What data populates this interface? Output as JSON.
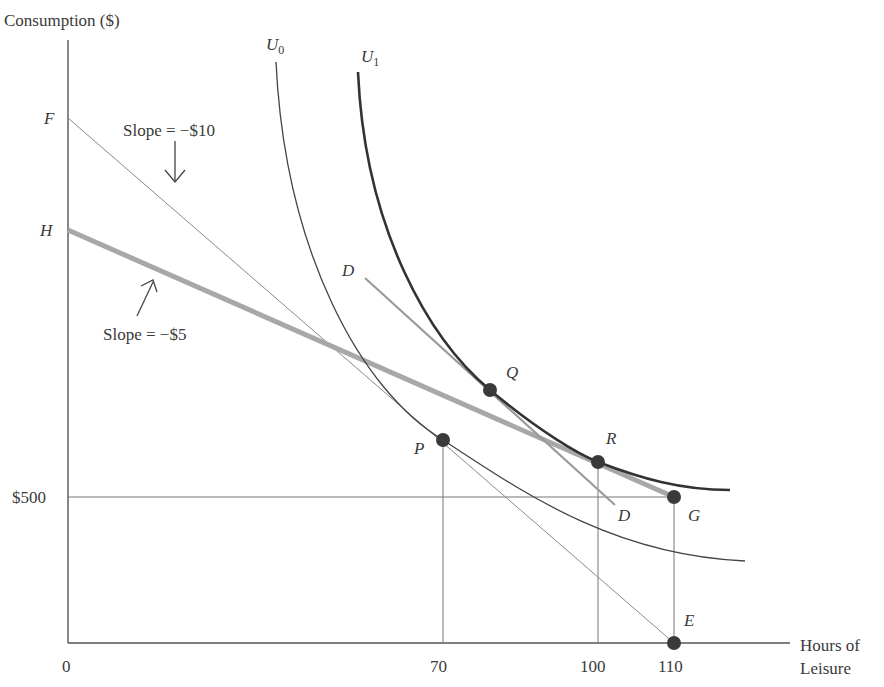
{
  "axes": {
    "y_label": "Consumption ($)",
    "x_label_line1": "Hours of",
    "x_label_line2": "Leisure",
    "origin": "0",
    "y_ticks": {
      "F": "F",
      "H": "H",
      "income": "$500"
    },
    "x_ticks": [
      "70",
      "100",
      "110"
    ]
  },
  "curves": {
    "u0": {
      "name": "U",
      "sub": "0"
    },
    "u1": {
      "name": "U",
      "sub": "1"
    }
  },
  "budget_lines": {
    "fe": {
      "slope_label": "Slope = −$10"
    },
    "hg": {
      "slope_label": "Slope = −$5"
    },
    "dd": {
      "start": "D",
      "end": "D"
    }
  },
  "points": {
    "P": "P",
    "Q": "Q",
    "R": "R",
    "G": "G",
    "E": "E"
  },
  "colors": {
    "axis": "#555555",
    "thin_line": "#8a8a8a",
    "thick_budget": "#a8a8a8",
    "dd_line": "#9a9a9a",
    "u0": "#444444",
    "u1": "#333333",
    "dots": "#3a3a3a"
  }
}
